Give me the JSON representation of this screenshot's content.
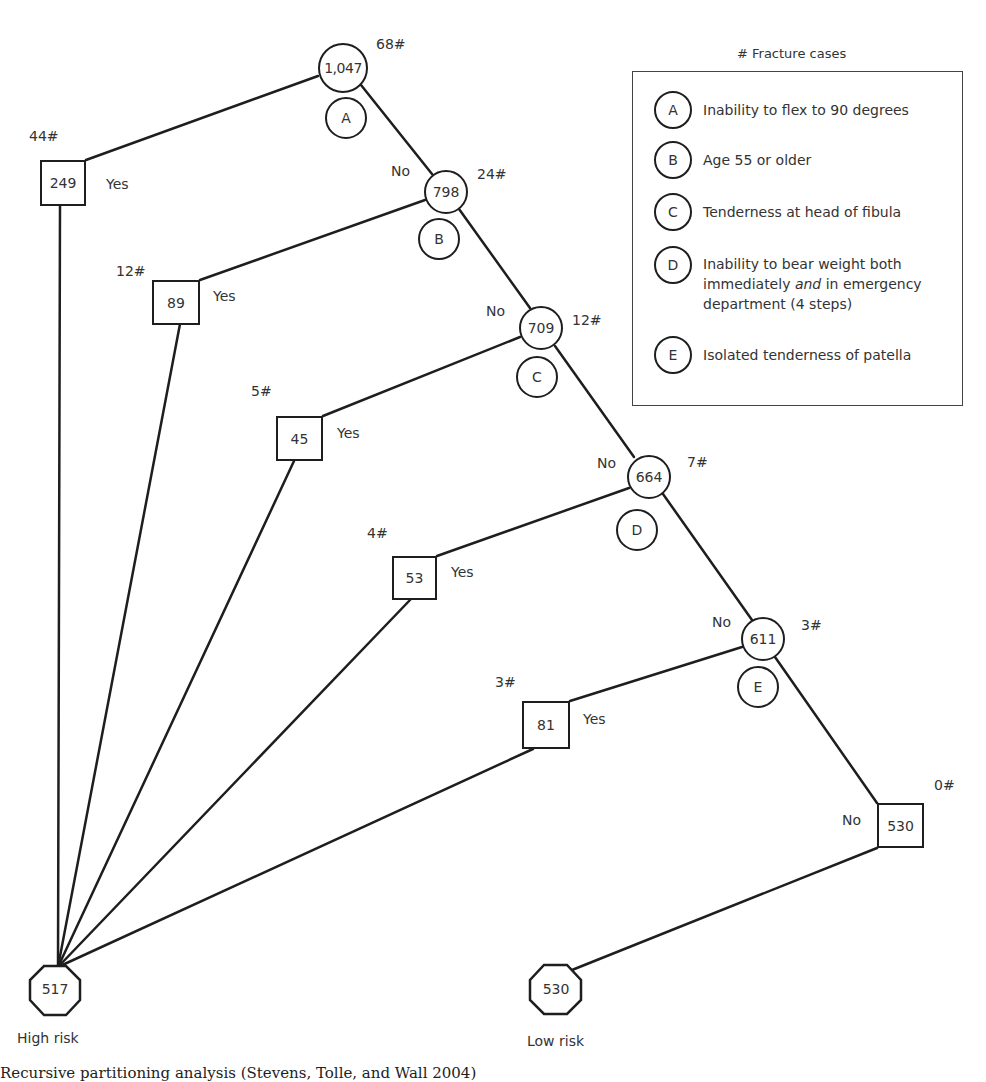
{
  "legend": {
    "title": "# Fracture cases",
    "items": [
      {
        "key": "A",
        "text": "Inability to flex to 90 degrees"
      },
      {
        "key": "B",
        "text": "Age 55 or older"
      },
      {
        "key": "C",
        "text": "Tenderness at head of fibula"
      },
      {
        "key": "D",
        "text_before": "Inability to bear weight both immediately ",
        "text_em": "and",
        "text_after": " in emergency department (4 steps)"
      },
      {
        "key": "E",
        "text": "Isolated tenderness of patella"
      }
    ]
  },
  "tree": {
    "decision_nodes": [
      {
        "id": "root",
        "count": "1,047",
        "fractures": "68#",
        "criterion": "A"
      },
      {
        "id": "n798",
        "count": "798",
        "fractures": "24#",
        "criterion": "B",
        "branch": "No"
      },
      {
        "id": "n709",
        "count": "709",
        "fractures": "12#",
        "criterion": "C",
        "branch": "No"
      },
      {
        "id": "n664",
        "count": "664",
        "fractures": "7#",
        "criterion": "D",
        "branch": "No"
      },
      {
        "id": "n611",
        "count": "611",
        "fractures": "3#",
        "criterion": "E",
        "branch": "No"
      }
    ],
    "yes_leaves": [
      {
        "count": "249",
        "fractures": "44#",
        "branch": "Yes"
      },
      {
        "count": "89",
        "fractures": "12#",
        "branch": "Yes"
      },
      {
        "count": "45",
        "fractures": "5#",
        "branch": "Yes"
      },
      {
        "count": "53",
        "fractures": "4#",
        "branch": "Yes"
      },
      {
        "count": "81",
        "fractures": "3#",
        "branch": "Yes"
      }
    ],
    "no_leaf": {
      "count": "530",
      "fractures": "0#",
      "branch": "No"
    },
    "outcomes": {
      "high": {
        "count": "517",
        "label": "High risk"
      },
      "low": {
        "count": "530",
        "label": "Low risk"
      }
    }
  },
  "caption": "Recursive partitioning analysis (Stevens, Tolle, and Wall 2004)"
}
